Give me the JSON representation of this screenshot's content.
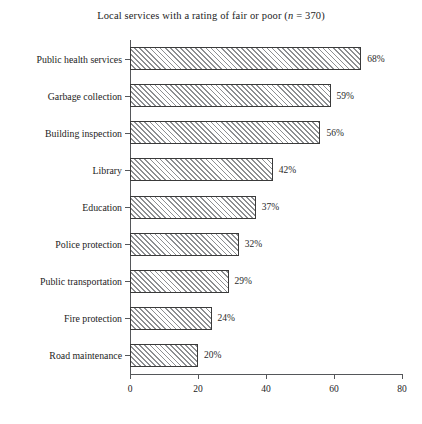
{
  "chart_data": {
    "type": "bar",
    "orientation": "horizontal",
    "title": "Local services with a rating of fair or poor (n = 370)",
    "title_prefix": "Local services with a rating of fair or poor (",
    "title_italic": "n",
    "title_suffix": " = 370)",
    "xlabel": "",
    "ylabel": "",
    "xlim": [
      0,
      80
    ],
    "xticks": [
      0,
      20,
      40,
      60,
      80
    ],
    "xtick_labels": [
      "0",
      "20",
      "40",
      "60",
      "80"
    ],
    "grid": false,
    "legend": false,
    "sample_size": 370,
    "categories": [
      "Public health services",
      "Garbage collection",
      "Building inspection",
      "Library",
      "Education",
      "Police protection",
      "Public transportation",
      "Fire protection",
      "Road maintenance"
    ],
    "values": [
      68,
      59,
      56,
      42,
      37,
      32,
      29,
      24,
      20
    ],
    "value_labels": [
      "68%",
      "59%",
      "56%",
      "42%",
      "37%",
      "32%",
      "29%",
      "24%",
      "20%"
    ],
    "bar_style": {
      "fill": "diagonal-hatch",
      "hatch_color": "#8d8f92",
      "background": "#ffffff",
      "border_color": "#3a3a3a"
    },
    "axis_color": "#55575a"
  }
}
